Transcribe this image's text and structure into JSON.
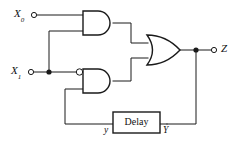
{
  "figure": {
    "type": "logic-circuit-diagram",
    "background_color": "#ffffff",
    "line_color": "#1a1a1a"
  },
  "labels": {
    "input_0_base": "X",
    "input_0_sub": "0",
    "input_1_base": "X",
    "input_1_sub": "1",
    "output": "Z",
    "delay_input": "y",
    "delay_output": "Y",
    "delay_box": "Delay"
  },
  "components": [
    {
      "id": "and-gate-top",
      "name": "and-gate",
      "label": "AND",
      "inputs": [
        "X0",
        "X1"
      ],
      "inverted_inputs": []
    },
    {
      "id": "and-gate-bottom",
      "name": "and-gate-inverted-input",
      "label": "AND",
      "inputs": [
        "X1",
        "y"
      ],
      "inverted_inputs": [
        "X1"
      ]
    },
    {
      "id": "or-gate",
      "name": "or-gate",
      "label": "OR",
      "inputs": [
        "and-gate-top",
        "and-gate-bottom"
      ],
      "output": "Z"
    },
    {
      "id": "delay-block",
      "name": "delay-element",
      "label": "Delay",
      "input": "Y",
      "output": "y"
    }
  ],
  "terminals": [
    {
      "id": "terminal-x0",
      "label": "X0",
      "kind": "input"
    },
    {
      "id": "terminal-x1",
      "label": "X1",
      "kind": "input"
    },
    {
      "id": "terminal-z",
      "label": "Z",
      "kind": "output"
    }
  ]
}
